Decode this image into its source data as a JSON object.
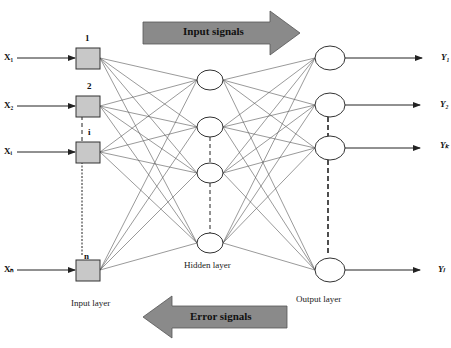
{
  "diagram": {
    "type": "neural-network",
    "colors": {
      "node_fill": "#c8c8c8",
      "arrow_fill": "#8a8a8a",
      "line": "#333333",
      "background": "#ffffff"
    },
    "signals": {
      "forward": "Input signals",
      "backward": "Error signals"
    },
    "input_layer": {
      "label": "Input layer",
      "nodes": [
        {
          "index": "1",
          "input": "X₁"
        },
        {
          "index": "2",
          "input": "X₂"
        },
        {
          "index": "i",
          "input": "Xᵢ"
        },
        {
          "index": "n",
          "input": "Xₙ"
        }
      ]
    },
    "hidden_layer": {
      "label": "Hidden layer",
      "node_count_shown": 4
    },
    "output_layer": {
      "label": "Output layer",
      "nodes": [
        {
          "output": "Y₁"
        },
        {
          "output": "Y₂"
        },
        {
          "output": "Yₖ"
        },
        {
          "output": "Yₗ"
        }
      ]
    }
  }
}
